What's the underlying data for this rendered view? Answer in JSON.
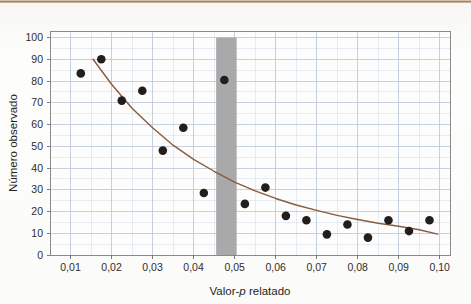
{
  "figure": {
    "background_color": "#fbfafa",
    "top_band_color": "#a87e59"
  },
  "chart_data": {
    "type": "scatter",
    "title": "",
    "subtitle": "",
    "xlabel_prefix": "Valor-",
    "xlabel_italic": "p",
    "xlabel_suffix": " relatado",
    "xlabel": "Valor-p relatado",
    "ylabel": "Número observado",
    "xlim": [
      0.005,
      0.1025
    ],
    "ylim": [
      0,
      103
    ],
    "xticks": [
      0.01,
      0.02,
      0.03,
      0.04,
      0.05,
      0.06,
      0.07,
      0.08,
      0.09,
      0.1
    ],
    "xtick_labels": [
      "0,01",
      "0,02",
      "0,03",
      "0,04",
      "0,05",
      "0,06",
      "0,07",
      "0,08",
      "0,09",
      "0,10"
    ],
    "yticks": [
      0,
      10,
      20,
      30,
      40,
      50,
      60,
      70,
      80,
      90,
      100
    ],
    "ytick_labels": [
      "0",
      "10",
      "20",
      "30",
      "40",
      "50",
      "60",
      "70",
      "80",
      "90",
      "100"
    ],
    "grid": true,
    "grid_major_color": "#b9c6d6",
    "grid_minor_color": "#dce4ee",
    "legend": "none",
    "panel_background": "#fdfdfd",
    "panel_border_color": "#8a8a8a",
    "series": [
      {
        "name": "Número observado",
        "type": "scatter",
        "marker": "circle",
        "marker_color": "#231d1c",
        "marker_size": 6.4,
        "x": [
          0.0125,
          0.0175,
          0.0225,
          0.0275,
          0.0325,
          0.0375,
          0.0425,
          0.0475,
          0.0525,
          0.0575,
          0.0625,
          0.0675,
          0.0725,
          0.0775,
          0.0825,
          0.0875,
          0.0925,
          0.0975
        ],
        "y": [
          83.5,
          90,
          71,
          75.5,
          48,
          58.5,
          28.5,
          80.5,
          23.5,
          31,
          18,
          16,
          9.5,
          14,
          8,
          16,
          11,
          16
        ]
      },
      {
        "name": "Curva ajustada",
        "type": "line",
        "line_color": "#8a5a3b",
        "line_width": 1.4,
        "x": [
          0.0155,
          0.02,
          0.025,
          0.03,
          0.035,
          0.04,
          0.045,
          0.05,
          0.055,
          0.06,
          0.065,
          0.07,
          0.075,
          0.08,
          0.085,
          0.09,
          0.095,
          0.0995
        ],
        "y": [
          90,
          78.5,
          67.5,
          58.5,
          50.5,
          44,
          38.5,
          33.5,
          29.5,
          26,
          23,
          20.5,
          18.2,
          16.3,
          14.6,
          13.2,
          11.6,
          9.6
        ]
      }
    ],
    "annotations": [
      {
        "type": "vertical-band",
        "name": "highlight-band",
        "x_start": 0.0455,
        "x_end": 0.0505,
        "y_start": 0,
        "y_end": 100,
        "color": "#a9a9a9"
      }
    ]
  }
}
